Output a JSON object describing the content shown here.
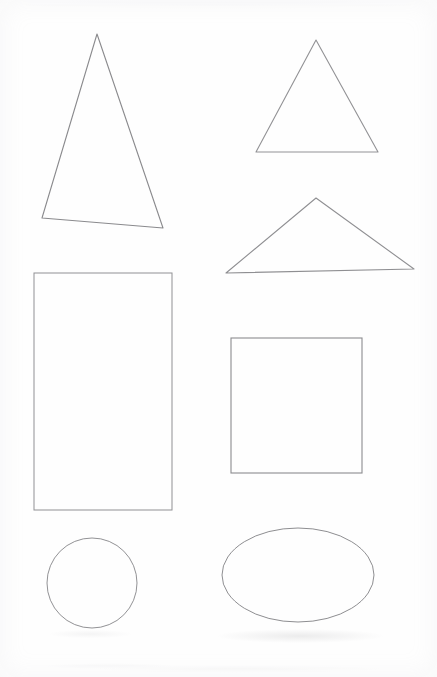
{
  "document": {
    "title": "Geometric Shapes Line Drawing",
    "medium": "scanned hand-drawn line art",
    "background_color": "#fefefe",
    "stroke_color": "#8d8d90",
    "stroke_width": "1",
    "fill": "none",
    "width": 437,
    "height": 677,
    "shape_count": "7"
  },
  "shapes": [
    {
      "id": "triangle-tall-narrow",
      "name": "Tall narrow triangle",
      "type": "triangle",
      "points": "97,34 163,228 42,218",
      "stroke": "#8a8a8d",
      "stroke_width": "1.1",
      "position": "top-left",
      "apex": "97,34",
      "base_left": "42,218",
      "base_right": "163,228"
    },
    {
      "id": "triangle-upright",
      "name": "Upright triangle",
      "type": "triangle",
      "points": "316,40 378,152 256,152",
      "stroke": "#929295",
      "stroke_width": "1.1",
      "position": "top-right",
      "apex": "316,40",
      "base_left": "256,152",
      "base_right": "378,152"
    },
    {
      "id": "triangle-wide-flat",
      "name": "Wide flat obtuse triangle",
      "type": "triangle",
      "points": "316,198 414,269 226,273",
      "stroke": "#8f8f92",
      "stroke_width": "1.1",
      "position": "middle-right",
      "apex": "316,198",
      "base_left": "226,273",
      "base_right": "414,269"
    },
    {
      "id": "rectangle-tall",
      "name": "Tall rectangle",
      "type": "rectangle",
      "x": "34",
      "y": "273",
      "width": "138",
      "height": "237",
      "stroke": "#909093",
      "stroke_width": "1",
      "position": "middle-left"
    },
    {
      "id": "square",
      "name": "Square",
      "type": "rectangle",
      "x": "231",
      "y": "338",
      "width": "131",
      "height": "135",
      "stroke": "#8b8b8e",
      "stroke_width": "1.1",
      "position": "middle-right"
    },
    {
      "id": "circle",
      "name": "Circle",
      "type": "ellipse",
      "cx": "92",
      "cy": "583",
      "rx": "45",
      "ry": "45",
      "stroke": "#929295",
      "stroke_width": "1",
      "position": "bottom-left"
    },
    {
      "id": "ellipse",
      "name": "Ellipse",
      "type": "ellipse",
      "cx": "298",
      "cy": "575",
      "rx": "76",
      "ry": "47",
      "stroke": "#8e8e91",
      "stroke_width": "1",
      "position": "bottom-right"
    }
  ]
}
